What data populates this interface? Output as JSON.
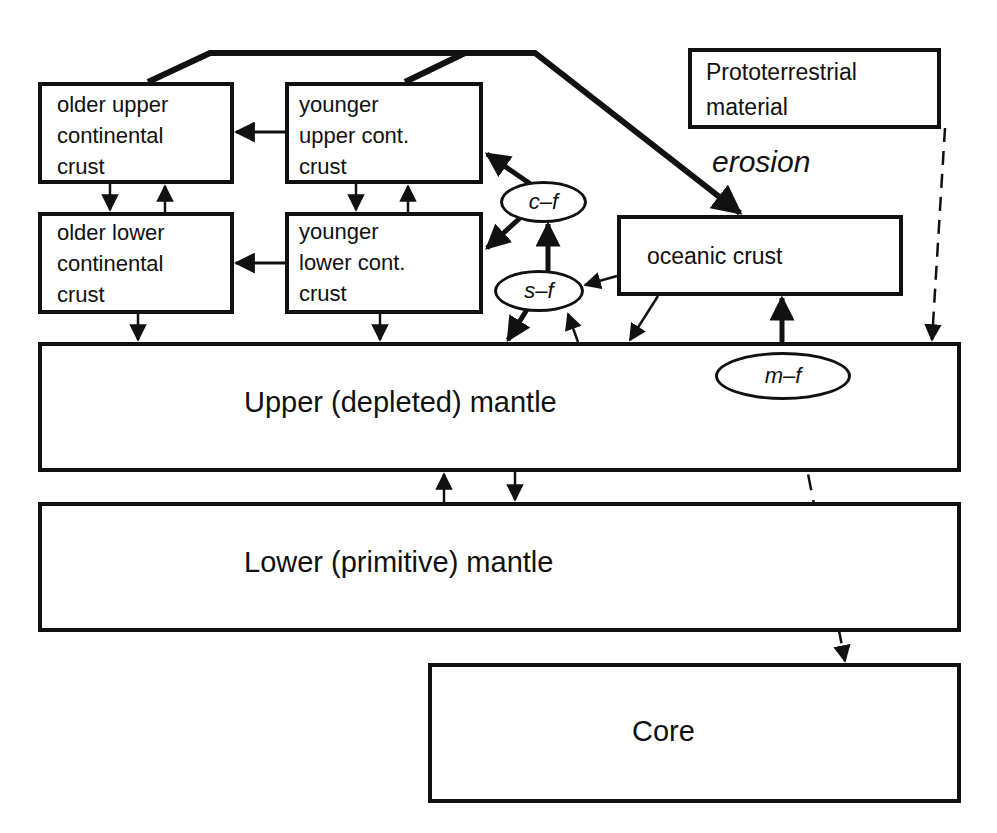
{
  "diagram": {
    "type": "flow-diagram",
    "boxes": {
      "older_upper_crust": {
        "label": "older upper\ncontinental\ncrust"
      },
      "younger_upper_crust": {
        "label": "younger\nupper cont.\ncrust"
      },
      "older_lower_crust": {
        "label": "older lower\ncontinental\ncrust"
      },
      "younger_lower_crust": {
        "label": "younger\nlower cont.\ncrust"
      },
      "prototerrestrial": {
        "label": "Prototerrestrial\nmaterial"
      },
      "oceanic_crust": {
        "label": "oceanic crust"
      },
      "upper_mantle": {
        "label": "Upper (depleted) mantle"
      },
      "lower_mantle": {
        "label": "Lower (primitive) mantle"
      },
      "core": {
        "label": "Core"
      }
    },
    "processes": {
      "cf": {
        "label": "c–f"
      },
      "sf": {
        "label": "s–f"
      },
      "mf": {
        "label": "m–f"
      },
      "erosion": {
        "label": "erosion"
      }
    },
    "edges": [
      {
        "from": "older upper continental crust + younger upper cont. crust",
        "to": "oceanic crust",
        "via": "erosion",
        "style": "thick"
      },
      {
        "from": "younger upper cont. crust",
        "to": "older upper continental crust",
        "style": "solid"
      },
      {
        "from": "younger lower cont. crust",
        "to": "older lower continental crust",
        "style": "solid"
      },
      {
        "from": "older upper continental crust",
        "to": "older lower continental crust",
        "style": "solid"
      },
      {
        "from": "older lower continental crust",
        "to": "older upper continental crust",
        "style": "solid"
      },
      {
        "from": "younger upper cont. crust",
        "to": "younger lower cont. crust",
        "style": "solid"
      },
      {
        "from": "younger lower cont. crust",
        "to": "younger upper cont. crust",
        "style": "solid"
      },
      {
        "from": "older lower continental crust",
        "to": "Upper (depleted) mantle",
        "style": "solid"
      },
      {
        "from": "younger lower cont. crust",
        "to": "Upper (depleted) mantle",
        "style": "solid"
      },
      {
        "from": "c-f",
        "to": "younger upper cont. crust",
        "style": "thick"
      },
      {
        "from": "c-f",
        "to": "younger lower cont. crust",
        "style": "thick"
      },
      {
        "from": "s-f",
        "to": "c-f",
        "style": "thick"
      },
      {
        "from": "s-f",
        "to": "Upper (depleted) mantle",
        "style": "thick"
      },
      {
        "from": "Upper (depleted) mantle",
        "to": "s-f",
        "style": "solid"
      },
      {
        "from": "oceanic crust",
        "to": "s-f",
        "style": "solid"
      },
      {
        "from": "oceanic crust",
        "to": "Upper (depleted) mantle",
        "style": "solid"
      },
      {
        "from": "m-f",
        "to": "oceanic crust",
        "style": "thick"
      },
      {
        "from": "Prototerrestrial material",
        "to": "Upper (depleted) mantle",
        "style": "dashed"
      },
      {
        "from": "m-f",
        "to": "Core",
        "style": "dashed"
      },
      {
        "from": "Upper (depleted) mantle",
        "to": "Lower (primitive) mantle",
        "style": "solid"
      },
      {
        "from": "Lower (primitive) mantle",
        "to": "Upper (depleted) mantle",
        "style": "solid"
      }
    ]
  }
}
